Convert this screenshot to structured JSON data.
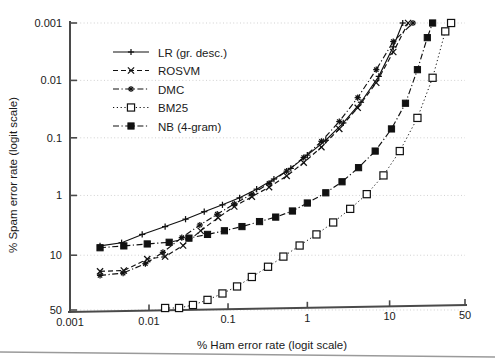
{
  "figure": {
    "background": "#ffffff",
    "ink_color": "#111111",
    "grid_color": "#cccccc",
    "axis_color": "#4a4a4a"
  },
  "chart_data": {
    "type": "line",
    "title": "",
    "subtitle": "",
    "xlabel": "% Ham error rate (logit scale)",
    "ylabel": "% Spam error rate (logit scale)",
    "xscale": "logit",
    "yscale": "logit",
    "y_inverted": true,
    "grid": true,
    "grid_axis": "y",
    "legend_position": "upper-left-inside",
    "xlim": [
      0.001,
      50
    ],
    "ylim": [
      0.001,
      50
    ],
    "xticks": [
      0.001,
      0.01,
      0.1,
      1,
      10,
      50
    ],
    "xticklabels": [
      "0.001",
      "0.01",
      "0.1",
      "1",
      "10",
      "50"
    ],
    "yticks": [
      0.001,
      0.01,
      0.1,
      1,
      10,
      50
    ],
    "yticklabels": [
      "0.001",
      "0.01",
      "0.1",
      "1",
      "10",
      "50"
    ],
    "series": [
      {
        "name": "LR (gr. desc.)",
        "marker": "plus",
        "linestyle": "solid",
        "color": "#111111",
        "points": [
          [
            0.0024,
            7.1
          ],
          [
            0.0045,
            6.3
          ],
          [
            0.0082,
            4.6
          ],
          [
            0.016,
            3.4
          ],
          [
            0.029,
            2.55
          ],
          [
            0.05,
            1.9
          ],
          [
            0.085,
            1.45
          ],
          [
            0.14,
            1.1
          ],
          [
            0.23,
            0.78
          ],
          [
            0.38,
            0.52
          ],
          [
            0.62,
            0.34
          ],
          [
            1.0,
            0.2
          ],
          [
            1.7,
            0.11
          ],
          [
            2.8,
            0.055
          ],
          [
            4.6,
            0.024
          ],
          [
            7.5,
            0.0085
          ],
          [
            11.0,
            0.0026
          ],
          [
            14.0,
            0.001
          ]
        ]
      },
      {
        "name": "ROSVM",
        "marker": "cross",
        "linestyle": "dashed",
        "color": "#111111",
        "points": [
          [
            0.0024,
            17.5
          ],
          [
            0.0048,
            17.0
          ],
          [
            0.0095,
            11.5
          ],
          [
            0.016,
            10.5
          ],
          [
            0.027,
            7.0
          ],
          [
            0.045,
            4.0
          ],
          [
            0.075,
            2.4
          ],
          [
            0.12,
            1.55
          ],
          [
            0.2,
            1.05
          ],
          [
            0.33,
            0.72
          ],
          [
            0.55,
            0.46
          ],
          [
            0.9,
            0.27
          ],
          [
            1.5,
            0.145
          ],
          [
            2.5,
            0.07
          ],
          [
            4.2,
            0.03
          ],
          [
            7.0,
            0.011
          ],
          [
            11.0,
            0.0032
          ],
          [
            16.0,
            0.001
          ]
        ]
      },
      {
        "name": "DMC",
        "marker": "star",
        "linestyle": "dashdot",
        "color": "#111111",
        "points": [
          [
            0.0024,
            20.0
          ],
          [
            0.0047,
            18.5
          ],
          [
            0.009,
            13.5
          ],
          [
            0.015,
            9.0
          ],
          [
            0.026,
            5.2
          ],
          [
            0.044,
            3.2
          ],
          [
            0.073,
            2.1
          ],
          [
            0.12,
            1.4
          ],
          [
            0.2,
            0.95
          ],
          [
            0.33,
            0.62
          ],
          [
            0.55,
            0.38
          ],
          [
            0.9,
            0.22
          ],
          [
            1.5,
            0.115
          ],
          [
            2.5,
            0.052
          ],
          [
            4.2,
            0.02
          ],
          [
            7.0,
            0.0065
          ],
          [
            11.0,
            0.0021
          ],
          [
            18.0,
            0.001
          ]
        ]
      },
      {
        "name": "BM25",
        "marker": "open-square",
        "linestyle": "dotted",
        "color": "#111111",
        "points": [
          [
            0.016,
            48.0
          ],
          [
            0.024,
            48.0
          ],
          [
            0.036,
            45.0
          ],
          [
            0.055,
            40.0
          ],
          [
            0.085,
            34.0
          ],
          [
            0.13,
            28.0
          ],
          [
            0.2,
            21.0
          ],
          [
            0.32,
            15.0
          ],
          [
            0.5,
            10.5
          ],
          [
            0.8,
            7.0
          ],
          [
            1.3,
            4.6
          ],
          [
            2.1,
            2.9
          ],
          [
            3.4,
            1.7
          ],
          [
            5.4,
            0.95
          ],
          [
            8.5,
            0.45
          ],
          [
            13.0,
            0.17
          ],
          [
            20.0,
            0.045
          ],
          [
            28.0,
            0.009
          ],
          [
            36.0,
            0.0014
          ],
          [
            40.0,
            0.001
          ]
        ]
      },
      {
        "name": "NB (4-gram)",
        "marker": "filled-square",
        "linestyle": "dashdot",
        "color": "#111111",
        "points": [
          [
            0.0024,
            7.6
          ],
          [
            0.0048,
            7.1
          ],
          [
            0.0095,
            6.6
          ],
          [
            0.018,
            6.2
          ],
          [
            0.032,
            5.3
          ],
          [
            0.055,
            4.6
          ],
          [
            0.09,
            4.0
          ],
          [
            0.15,
            3.4
          ],
          [
            0.25,
            2.8
          ],
          [
            0.4,
            2.35
          ],
          [
            0.65,
            1.85
          ],
          [
            1.0,
            1.35
          ],
          [
            1.7,
            0.9
          ],
          [
            2.7,
            0.58
          ],
          [
            4.3,
            0.33
          ],
          [
            6.8,
            0.17
          ],
          [
            10.5,
            0.07
          ],
          [
            15.0,
            0.025
          ],
          [
            20.0,
            0.0065
          ],
          [
            25.0,
            0.0018
          ],
          [
            28.0,
            0.001
          ]
        ]
      }
    ]
  },
  "legend": {
    "entries": [
      {
        "label": "LR (gr. desc.)",
        "marker": "plus",
        "linestyle": "solid"
      },
      {
        "label": "ROSVM",
        "marker": "cross",
        "linestyle": "dashed"
      },
      {
        "label": "DMC",
        "marker": "star",
        "linestyle": "dashdot"
      },
      {
        "label": "BM25",
        "marker": "open-square",
        "linestyle": "dotted"
      },
      {
        "label": "NB (4-gram)",
        "marker": "filled-square",
        "linestyle": "dashdot"
      }
    ]
  }
}
